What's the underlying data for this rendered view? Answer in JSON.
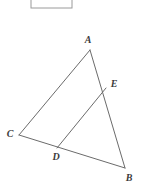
{
  "figure": {
    "type": "geometry-diagram",
    "stroke_color": "#6b6b6b",
    "label_color": "#3b3b3b",
    "background_color": "#ffffff",
    "canvas": {
      "width": 141,
      "height": 189
    },
    "points": [
      {
        "id": "A",
        "label": "A",
        "x": 90,
        "y": 50,
        "label_x": 88,
        "label_y": 40
      },
      {
        "id": "E",
        "label": "E",
        "x": 106,
        "y": 88,
        "label_x": 114,
        "label_y": 84
      },
      {
        "id": "C",
        "label": "C",
        "x": 19,
        "y": 135,
        "label_x": 10,
        "label_y": 134
      },
      {
        "id": "D",
        "label": "D",
        "x": 57,
        "y": 148,
        "label_x": 56,
        "label_y": 157
      },
      {
        "id": "B",
        "label": "B",
        "x": 125,
        "y": 168,
        "label_x": 129,
        "label_y": 178
      }
    ],
    "segments": [
      {
        "name": "segment-AC",
        "from": "A",
        "to": "C"
      },
      {
        "name": "segment-AB",
        "from": "A",
        "to": "B"
      },
      {
        "name": "segment-CB",
        "from": "C",
        "to": "B"
      },
      {
        "name": "segment-DE",
        "from": "D",
        "to": "E"
      }
    ]
  },
  "top_box": {
    "name": "cropped-rectangle",
    "x": 31,
    "y": -8,
    "width": 41,
    "height": 16
  }
}
